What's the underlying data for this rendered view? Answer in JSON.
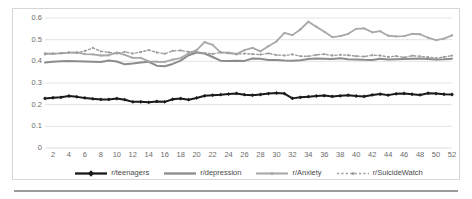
{
  "artifact_text": "",
  "chart_data": {
    "type": "line",
    "title": "",
    "xlabel": "",
    "ylabel": "",
    "ylim": [
      0,
      0.6
    ],
    "xlim": [
      1,
      52
    ],
    "grid": true,
    "legend_position": "bottom",
    "y_ticks": [
      "0",
      "0.1",
      "0.2",
      "0.3",
      "0.4",
      "0.5",
      "0.6"
    ],
    "y_tick_values": [
      0,
      0.1,
      0.2,
      0.3,
      0.4,
      0.5,
      0.6
    ],
    "x_ticks": [
      "2",
      "4",
      "6",
      "8",
      "10",
      "12",
      "14",
      "16",
      "18",
      "20",
      "22",
      "24",
      "26",
      "28",
      "30",
      "32",
      "34",
      "36",
      "38",
      "40",
      "42",
      "44",
      "46",
      "48",
      "50",
      "52"
    ],
    "x_tick_values": [
      2,
      4,
      6,
      8,
      10,
      12,
      14,
      16,
      18,
      20,
      22,
      24,
      26,
      28,
      30,
      32,
      34,
      36,
      38,
      40,
      42,
      44,
      46,
      48,
      50,
      52
    ],
    "x": [
      1,
      2,
      3,
      4,
      5,
      6,
      7,
      8,
      9,
      10,
      11,
      12,
      13,
      14,
      15,
      16,
      17,
      18,
      19,
      20,
      21,
      22,
      23,
      24,
      25,
      26,
      27,
      28,
      29,
      30,
      31,
      32,
      33,
      34,
      35,
      36,
      37,
      38,
      39,
      40,
      41,
      42,
      43,
      44,
      45,
      46,
      47,
      48,
      49,
      50,
      51,
      52
    ],
    "series": [
      {
        "name": "r/teenagers",
        "color": "#1a1a1a",
        "marker": "diamond",
        "dashed": false,
        "width": 2.0,
        "values": [
          0.229,
          0.232,
          0.234,
          0.24,
          0.236,
          0.231,
          0.227,
          0.224,
          0.224,
          0.228,
          0.223,
          0.213,
          0.213,
          0.211,
          0.215,
          0.213,
          0.225,
          0.228,
          0.223,
          0.231,
          0.241,
          0.244,
          0.246,
          0.249,
          0.252,
          0.246,
          0.244,
          0.247,
          0.251,
          0.254,
          0.251,
          0.229,
          0.234,
          0.237,
          0.24,
          0.242,
          0.238,
          0.241,
          0.244,
          0.24,
          0.238,
          0.245,
          0.249,
          0.244,
          0.25,
          0.252,
          0.248,
          0.245,
          0.253,
          0.251,
          0.248,
          0.247
        ]
      },
      {
        "name": "r/depression",
        "color": "#8c8c8c",
        "marker": "none",
        "dashed": false,
        "width": 2.0,
        "values": [
          0.395,
          0.398,
          0.4,
          0.401,
          0.4,
          0.399,
          0.398,
          0.397,
          0.404,
          0.399,
          0.386,
          0.39,
          0.395,
          0.398,
          0.38,
          0.377,
          0.388,
          0.403,
          0.428,
          0.441,
          0.436,
          0.42,
          0.403,
          0.402,
          0.403,
          0.402,
          0.413,
          0.412,
          0.406,
          0.406,
          0.404,
          0.403,
          0.405,
          0.411,
          0.413,
          0.412,
          0.411,
          0.414,
          0.41,
          0.409,
          0.407,
          0.406,
          0.412,
          0.409,
          0.41,
          0.411,
          0.412,
          0.413,
          0.411,
          0.409,
          0.41,
          0.412
        ]
      },
      {
        "name": "r/Anxiety",
        "color": "#a8a8a8",
        "marker": "small",
        "dashed": false,
        "width": 1.8,
        "values": [
          0.437,
          0.436,
          0.437,
          0.44,
          0.441,
          0.433,
          0.432,
          0.427,
          0.428,
          0.44,
          0.43,
          0.416,
          0.416,
          0.4,
          0.398,
          0.397,
          0.408,
          0.415,
          0.437,
          0.452,
          0.489,
          0.476,
          0.441,
          0.44,
          0.434,
          0.452,
          0.462,
          0.446,
          0.47,
          0.492,
          0.531,
          0.521,
          0.547,
          0.583,
          0.56,
          0.536,
          0.512,
          0.516,
          0.527,
          0.55,
          0.552,
          0.534,
          0.539,
          0.518,
          0.515,
          0.516,
          0.527,
          0.525,
          0.509,
          0.498,
          0.505,
          0.52
        ]
      },
      {
        "name": "r/SuicideWatch",
        "color": "#9e9e9e",
        "marker": "dotted",
        "dashed": true,
        "width": 1.4,
        "values": [
          0.432,
          0.435,
          0.438,
          0.441,
          0.439,
          0.448,
          0.462,
          0.446,
          0.441,
          0.436,
          0.444,
          0.436,
          0.443,
          0.452,
          0.441,
          0.435,
          0.448,
          0.45,
          0.444,
          0.443,
          0.438,
          0.434,
          0.441,
          0.437,
          0.432,
          0.436,
          0.433,
          0.431,
          0.437,
          0.429,
          0.427,
          0.432,
          0.424,
          0.423,
          0.43,
          0.433,
          0.427,
          0.43,
          0.428,
          0.424,
          0.422,
          0.428,
          0.427,
          0.42,
          0.424,
          0.418,
          0.426,
          0.423,
          0.419,
          0.415,
          0.42,
          0.426
        ]
      }
    ]
  }
}
